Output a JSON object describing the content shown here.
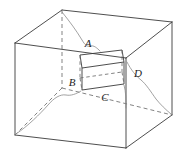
{
  "figure": {
    "labels": [
      {
        "id": "A",
        "text": "A",
        "x": 88,
        "y": 47
      },
      {
        "id": "B",
        "text": "B",
        "x": 72,
        "y": 86
      },
      {
        "id": "C",
        "text": "C",
        "x": 105,
        "y": 101
      },
      {
        "id": "D",
        "text": "D",
        "x": 138,
        "y": 77
      }
    ],
    "colors": {
      "background": "#ffffff",
      "solid_edge": "#3a3a3a",
      "hidden_edge": "#6d6d6d",
      "sketch_line": "#8a8a8a",
      "label_text": "#1c1c1c"
    },
    "outer_cube": {
      "name": "outer-cube",
      "vertices": {
        "top_back": [
          62,
          10
        ],
        "top_left": [
          15,
          43
        ],
        "top_right": [
          172,
          22
        ],
        "top_front": [
          126,
          58
        ],
        "bottom_back": [
          62,
          88
        ],
        "bottom_left": [
          15,
          135
        ],
        "bottom_right": [
          172,
          115
        ],
        "bottom_front": [
          126,
          148
        ]
      }
    },
    "inner_cube": {
      "name": "inner-cube",
      "vertices": {
        "top_back_left": [
          82,
          58
        ],
        "top_front_left": [
          80,
          55
        ],
        "top_back_right": [
          124,
          52
        ],
        "top_front_right": [
          122,
          62
        ],
        "bottom_back_left": [
          82,
          90
        ],
        "bottom_front_left": [
          80,
          86
        ],
        "bottom_back_right": [
          124,
          84
        ],
        "bottom_front_right": [
          122,
          94
        ]
      }
    }
  }
}
